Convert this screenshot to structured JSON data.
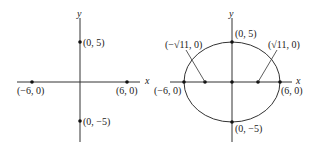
{
  "left": {
    "axis_x": "x",
    "axis_y": "y",
    "points": [
      {
        "label": "(0, 5)"
      },
      {
        "label": "(0, −5)"
      },
      {
        "label": "(−6, 0)"
      },
      {
        "label": "(6, 0)"
      }
    ]
  },
  "right": {
    "axis_x": "x",
    "axis_y": "y",
    "points": [
      {
        "label": "(0, 5)"
      },
      {
        "label": "(0, −5)"
      },
      {
        "label": "(−6, 0)"
      },
      {
        "label": "(6, 0)"
      },
      {
        "label": "(−√11, 0)"
      },
      {
        "label": "(√11, 0)"
      }
    ]
  },
  "colors": {
    "line": "#333333",
    "point": "#111111"
  }
}
